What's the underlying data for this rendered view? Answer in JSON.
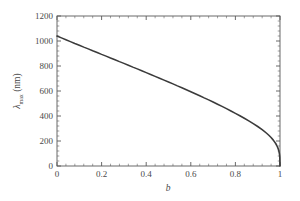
{
  "chart_data": {
    "type": "line",
    "title": "",
    "subtitle": "",
    "xlabel": "b",
    "ylabel": "λ",
    "ylabel_sub": "max",
    "ylabel_unit": " (nm)",
    "ylabel_full": "λmax (nm)",
    "xlim": [
      0,
      1
    ],
    "ylim": [
      0,
      1200
    ],
    "grid": false,
    "legend": "none",
    "line_color": "#3b3b3b",
    "frame_color": "#5a5a5a",
    "background_color": "#ffffff",
    "xticks": [
      0,
      0.2,
      0.4,
      0.6,
      0.8,
      1
    ],
    "xtick_labels": [
      "0",
      "0.2",
      "0.4",
      "0.6",
      "0.8",
      "1"
    ],
    "xminor_count": 4,
    "yticks": [
      0,
      200,
      400,
      600,
      800,
      1000,
      1200
    ],
    "ytick_labels": [
      "0",
      "200",
      "400",
      "600",
      "800",
      "1000",
      "1200"
    ],
    "yminor_count": 4,
    "ticks_direction": "in",
    "ticks_all_sides": true,
    "series": [
      {
        "name": "lambda_max",
        "x": [
          0.0,
          0.02,
          0.04,
          0.06,
          0.08,
          0.1,
          0.12,
          0.14,
          0.16,
          0.18,
          0.2,
          0.22,
          0.24,
          0.26,
          0.28,
          0.3,
          0.32,
          0.34,
          0.36,
          0.38,
          0.4,
          0.42,
          0.44,
          0.46,
          0.48,
          0.5,
          0.52,
          0.54,
          0.56,
          0.58,
          0.6,
          0.62,
          0.64,
          0.66,
          0.68,
          0.7,
          0.72,
          0.74,
          0.76,
          0.78,
          0.8,
          0.82,
          0.84,
          0.86,
          0.88,
          0.9,
          0.92,
          0.94,
          0.95,
          0.96,
          0.97,
          0.98,
          0.985,
          0.99,
          0.993,
          0.995,
          0.997,
          0.998,
          0.999,
          1.0
        ],
        "values": [
          1040,
          1025,
          1010,
          995,
          980,
          966,
          951,
          937,
          922,
          908,
          893,
          879,
          864,
          850,
          835,
          821,
          806,
          791,
          777,
          762,
          747,
          732,
          717,
          702,
          687,
          672,
          657,
          641,
          626,
          610,
          594,
          578,
          562,
          545,
          529,
          512,
          494,
          477,
          459,
          440,
          421,
          402,
          382,
          361,
          339,
          316,
          291,
          262,
          246,
          228,
          207,
          182,
          166,
          147,
          132,
          119,
          102,
          90,
          72,
          0
        ]
      }
    ]
  },
  "axes": {
    "xlabel": "b",
    "ylabel_lambda": "λ",
    "ylabel_subscript": "max",
    "ylabel_units": "(nm)"
  }
}
